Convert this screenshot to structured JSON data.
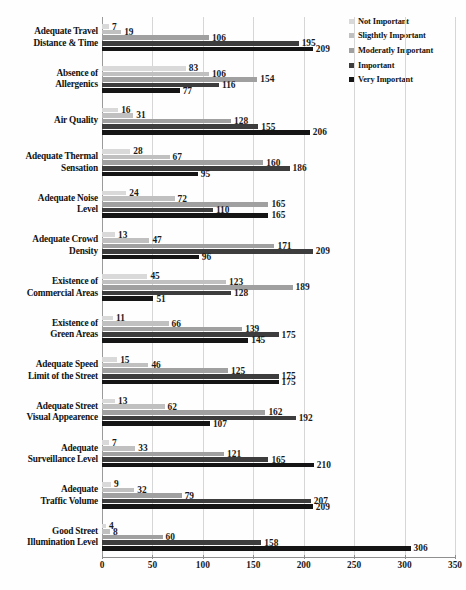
{
  "chart_data": {
    "type": "bar",
    "orientation": "horizontal",
    "title": "",
    "xlabel": "",
    "ylabel": "",
    "xlim": [
      0,
      350
    ],
    "xticks": [
      0,
      50,
      100,
      150,
      200,
      250,
      300,
      350
    ],
    "grid": true,
    "legend_position": "right-top",
    "categories": [
      "Adequate Travel Distance & Time",
      "Absence of Allergenics",
      "Air Quality",
      "Adequate Thermal Sensation",
      "Adequate Noise Level",
      "Adequate Crowd Density",
      "Existence of Commercial Areas",
      "Existence of Green Areas",
      "Adequate Speed Limit of the Street",
      "Adequate Street Visual Appearence",
      "Adequate Surveillance Level",
      "Adequate Traffic Volume",
      "Good Street Illumination Level"
    ],
    "category_lines": [
      [
        "Adequate Travel",
        "Distance & Time"
      ],
      [
        "Absence of",
        "Allergenics"
      ],
      [
        "Air Quality"
      ],
      [
        "Adequate Thermal",
        "Sensation"
      ],
      [
        "Adequate Noise",
        "Level"
      ],
      [
        "Adequate Crowd",
        "Density"
      ],
      [
        "Existence of",
        "Commercial Areas"
      ],
      [
        "Existence of",
        "Green Areas"
      ],
      [
        "Adequate Speed",
        "Limit of the Street"
      ],
      [
        "Adequate Street",
        "Visual Appearence"
      ],
      [
        "Adequate",
        "Surveillance Level"
      ],
      [
        "Adequate",
        "Traffic Volume"
      ],
      [
        "Good Street",
        "Illumination Level"
      ]
    ],
    "series": [
      {
        "name": "Not Important",
        "color": "#d9d9d9",
        "values": [
          7,
          83,
          16,
          28,
          24,
          13,
          45,
          11,
          15,
          13,
          7,
          9,
          4
        ]
      },
      {
        "name": "Sligthtly Important",
        "color": "#c0c0c0",
        "values": [
          19,
          106,
          31,
          67,
          72,
          47,
          123,
          66,
          46,
          62,
          33,
          32,
          8
        ]
      },
      {
        "name": "Moderatly Important",
        "color": "#a0a0a0",
        "values": [
          106,
          154,
          128,
          160,
          165,
          171,
          189,
          139,
          125,
          162,
          121,
          79,
          60
        ]
      },
      {
        "name": "Important",
        "color": "#3d3d3d",
        "values": [
          195,
          116,
          155,
          186,
          110,
          209,
          128,
          175,
          175,
          192,
          165,
          207,
          158
        ]
      },
      {
        "name": "Very Important",
        "color": "#151515",
        "values": [
          209,
          77,
          206,
          95,
          165,
          96,
          51,
          145,
          175,
          107,
          210,
          209,
          306
        ]
      }
    ]
  },
  "legend": {
    "items": [
      {
        "label": "Not Important",
        "color": "#d9d9d9"
      },
      {
        "label": "Sligthtly Important",
        "color": "#c0c0c0"
      },
      {
        "label": "Moderatly Important",
        "color": "#a0a0a0"
      },
      {
        "label": "Important",
        "color": "#3d3d3d"
      },
      {
        "label": "Very Important",
        "color": "#151515"
      }
    ]
  }
}
